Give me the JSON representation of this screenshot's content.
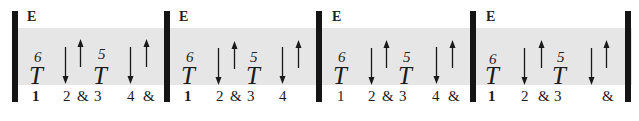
{
  "colors": {
    "band": "#e6e6e6",
    "barline": "#151515",
    "ink": "#1a1a1a"
  },
  "measures": [
    {
      "chord": "E",
      "beats": [
        {
          "fret": "6",
          "stroke": "T"
        },
        {
          "fret": "5",
          "stroke": "T"
        }
      ],
      "arrows": [
        "down",
        "up",
        "down",
        "up"
      ],
      "counts": [
        "1",
        "2",
        "&",
        "3",
        "4",
        "&"
      ]
    },
    {
      "chord": "E",
      "beats": [
        {
          "fret": "6",
          "stroke": "T"
        },
        {
          "fret": "5",
          "stroke": "T"
        }
      ],
      "arrows": [
        "down",
        "up",
        "down",
        "up"
      ],
      "counts": [
        "1",
        "2",
        "&",
        "3",
        "4",
        ""
      ]
    },
    {
      "chord": "E",
      "beats": [
        {
          "fret": "6",
          "stroke": "T"
        },
        {
          "fret": "5",
          "stroke": "T"
        }
      ],
      "arrows": [
        "down",
        "up",
        "down",
        "up"
      ],
      "counts": [
        "1",
        "2",
        "&",
        "3",
        "4",
        "&"
      ]
    },
    {
      "chord": "E",
      "beats": [
        {
          "fret": "6",
          "stroke": "T"
        },
        {
          "fret": "5",
          "stroke": "T"
        }
      ],
      "arrows": [
        "down",
        "up",
        "down",
        "up"
      ],
      "counts": [
        "1",
        "2",
        "&",
        "3",
        "4",
        "&"
      ]
    }
  ]
}
